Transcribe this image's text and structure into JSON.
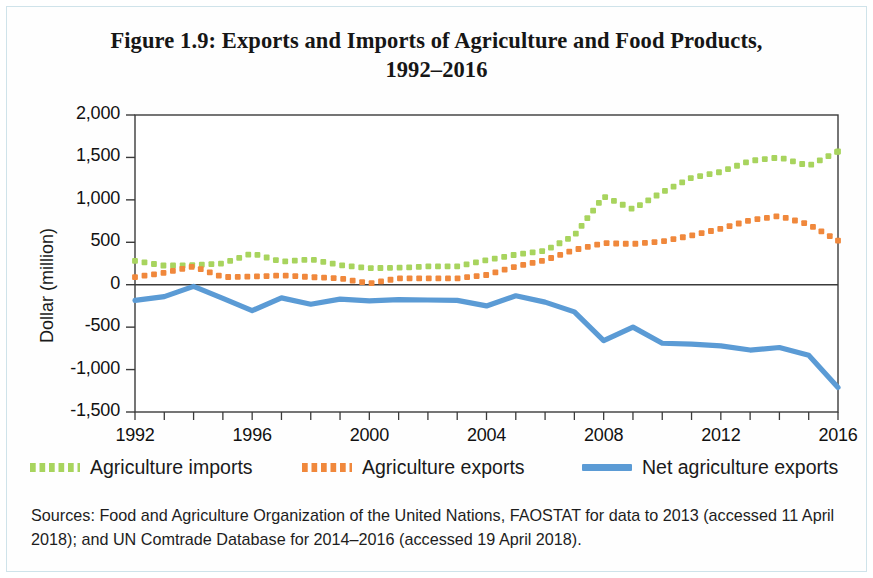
{
  "figure": {
    "title_line1": "Figure 1.9: Exports and Imports of Agriculture and Food Products,",
    "title_line2": "1992–2016",
    "sources": "Sources: Food and Agriculture Organization of the United Nations, FAOSTAT for data to 2013 (accessed 11 April 2018); and UN Comtrade Database for 2014–2016 (accessed 19 April 2018)."
  },
  "legend": {
    "items": [
      {
        "label": "Agriculture imports",
        "color": "#a8d45e",
        "style": "dotted"
      },
      {
        "label": "Agriculture exports",
        "color": "#f0883c",
        "style": "dotted"
      },
      {
        "label": "Net agriculture exports",
        "color": "#5b9bd5",
        "style": "solid"
      }
    ]
  },
  "axes": {
    "y_label": "Dollar (million)",
    "y_ticks": [
      "2,000",
      "1,500",
      "1,000",
      "500",
      "0",
      "-500",
      "-1,000",
      "-1,500"
    ],
    "x_ticks": [
      "1992",
      "1996",
      "2000",
      "2004",
      "2008",
      "2012",
      "2016"
    ]
  },
  "chart_data": {
    "type": "line",
    "title": "Figure 1.9: Exports and Imports of Agriculture and Food Products, 1992–2016",
    "xlabel": "",
    "ylabel": "Dollar (million)",
    "xlim": [
      1992,
      2016
    ],
    "ylim": [
      -1500,
      2000
    ],
    "ytick_values": [
      2000,
      1500,
      1000,
      500,
      0,
      -500,
      -1000,
      -1500
    ],
    "xtick_values": [
      1992,
      1996,
      2000,
      2004,
      2008,
      2012,
      2016
    ],
    "grid": false,
    "legend_position": "below",
    "x": [
      1992,
      1993,
      1994,
      1995,
      1996,
      1997,
      1998,
      1999,
      2000,
      2001,
      2002,
      2003,
      2004,
      2005,
      2006,
      2007,
      2008,
      2009,
      2010,
      2011,
      2012,
      2013,
      2014,
      2015,
      2016
    ],
    "series": [
      {
        "name": "Agriculture imports",
        "color": "#a8d45e",
        "style": "dotted",
        "values": [
          280,
          225,
          230,
          250,
          370,
          270,
          300,
          230,
          195,
          200,
          215,
          215,
          290,
          355,
          400,
          580,
          1040,
          890,
          1090,
          1260,
          1330,
          1460,
          1500,
          1400,
          1570
        ]
      },
      {
        "name": "Agriculture exports",
        "color": "#f0883c",
        "style": "dotted",
        "values": [
          90,
          140,
          215,
          90,
          95,
          110,
          90,
          75,
          15,
          75,
          75,
          75,
          115,
          215,
          290,
          410,
          490,
          480,
          510,
          580,
          660,
          760,
          810,
          710,
          520
        ]
      },
      {
        "name": "Net agriculture exports",
        "color": "#5b9bd5",
        "style": "solid",
        "values": [
          -185,
          -140,
          -20,
          -160,
          -305,
          -155,
          -230,
          -170,
          -190,
          -175,
          -180,
          -185,
          -250,
          -130,
          -205,
          -320,
          -660,
          -500,
          -690,
          -700,
          -720,
          -770,
          -740,
          -830,
          -1210
        ]
      }
    ]
  }
}
